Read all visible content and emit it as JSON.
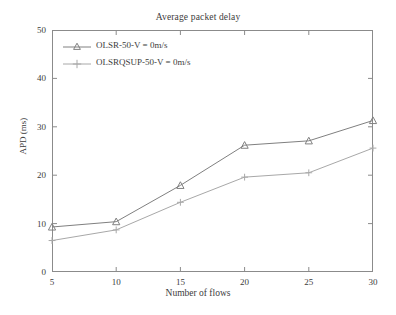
{
  "chart_data": {
    "type": "line",
    "title": "Average packet delay",
    "xlabel": "Number of flows",
    "ylabel": "APD (ms)",
    "x": [
      5,
      10,
      15,
      20,
      25,
      30
    ],
    "xlim": [
      5,
      30
    ],
    "ylim": [
      0,
      50
    ],
    "xticks": [
      "5",
      "10",
      "15",
      "20",
      "25",
      "30"
    ],
    "yticks": [
      "0",
      "10",
      "20",
      "30",
      "40",
      "50"
    ],
    "grid": false,
    "legend_position": "upper-left",
    "series": [
      {
        "name": "OLSR-50-V = 0m/s",
        "marker": "triangle-up",
        "color": "#808080",
        "values": [
          9.3,
          10.4,
          17.9,
          26.2,
          27.1,
          31.3
        ]
      },
      {
        "name": "OLSRQSUP-50-V = 0m/s",
        "marker": "plus",
        "color": "#a8a8a8",
        "values": [
          6.5,
          8.7,
          14.4,
          19.6,
          20.5,
          25.6
        ]
      }
    ]
  },
  "axis": {
    "frame_color": "#8b8b8b"
  }
}
